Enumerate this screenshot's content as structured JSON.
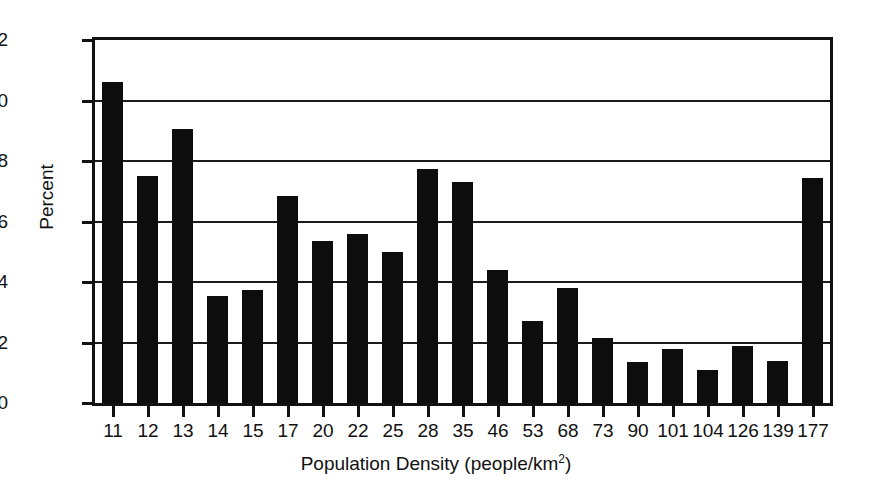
{
  "chart_data": {
    "type": "bar",
    "title": "",
    "subtitle": "",
    "xlabel": "Population Density (people/km2)",
    "xlabel_base": "Population Density (people/km",
    "xlabel_sup": "2",
    "xlabel_tail": ")",
    "ylabel": "Percent",
    "categories": [
      "11",
      "12",
      "13",
      "14",
      "15",
      "17",
      "20",
      "22",
      "25",
      "28",
      "35",
      "46",
      "53",
      "68",
      "73",
      "90",
      "101",
      "104",
      "126",
      "139",
      "177"
    ],
    "values": [
      10.6,
      7.5,
      9.05,
      3.55,
      3.75,
      6.85,
      5.35,
      5.6,
      5.0,
      7.75,
      7.3,
      4.4,
      2.7,
      3.8,
      2.15,
      1.35,
      1.8,
      1.1,
      1.9,
      1.4,
      7.45
    ],
    "ylim": [
      0,
      12
    ],
    "yticks": [
      0,
      2,
      4,
      6,
      8,
      10,
      12
    ],
    "ytick_labels": [
      "0",
      "2",
      "4",
      "6",
      "8",
      "10",
      "12"
    ],
    "grid": true,
    "grid_axis": "y",
    "legend": "none",
    "bar_color": "#0d0d0d",
    "axis_color": "#111111",
    "background_color": "#ffffff"
  }
}
